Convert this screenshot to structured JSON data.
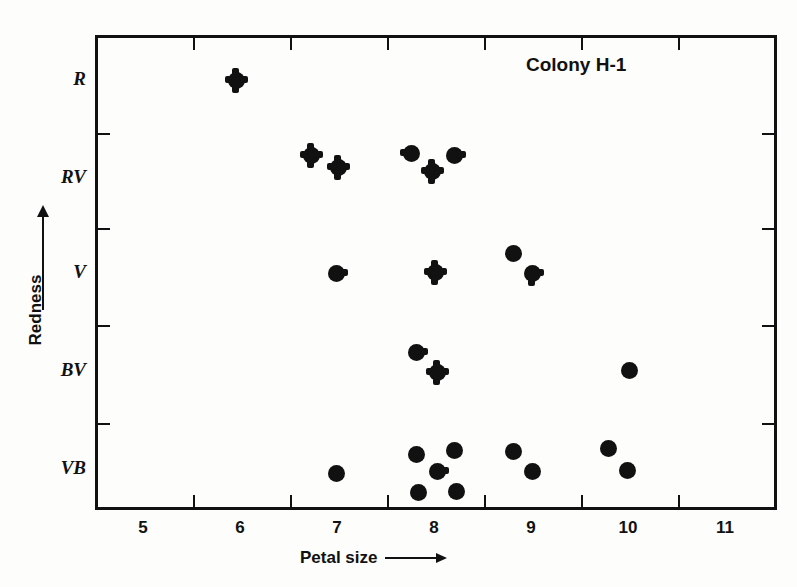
{
  "chart_data": {
    "type": "scatter",
    "title": "Colony H-1",
    "xlabel": "Petal size",
    "ylabel": "Redness",
    "grid": false,
    "legend": null,
    "xlim": [
      4.5,
      11.5
    ],
    "x_ticks": [
      5.5,
      6.5,
      7.5,
      8.5,
      9.5,
      10.5
    ],
    "x_tick_labels": [
      "5",
      "6",
      "7",
      "8",
      "9",
      "10",
      "11"
    ],
    "y_categories": [
      "VB",
      "BV",
      "V",
      "RV",
      "R"
    ],
    "y_tick_labels": [
      "R",
      "RV",
      "V",
      "BV",
      "VB"
    ],
    "y_axis_direction": "Redness increases upward",
    "points": [
      {
        "x": 5.95,
        "y": "R",
        "marker": "cross"
      },
      {
        "x": 6.72,
        "y": "R-RV",
        "marker": "cross"
      },
      {
        "x": 7.0,
        "y": "R-RV",
        "marker": "cross"
      },
      {
        "x": 7.75,
        "y": "R-RV",
        "marker": "spur-left"
      },
      {
        "x": 8.2,
        "y": "R-RV",
        "marker": "spur-right"
      },
      {
        "x": 7.97,
        "y": "R-RV",
        "marker": "cross"
      },
      {
        "x": 6.98,
        "y": "V",
        "marker": "spur-right"
      },
      {
        "x": 8.0,
        "y": "V",
        "marker": "cross"
      },
      {
        "x": 8.8,
        "y": "V",
        "marker": "circle"
      },
      {
        "x": 9.0,
        "y": "V",
        "marker": "spur-right-down"
      },
      {
        "x": 7.8,
        "y": "BV",
        "marker": "spur-right"
      },
      {
        "x": 8.02,
        "y": "BV",
        "marker": "cross"
      },
      {
        "x": 10.0,
        "y": "BV",
        "marker": "circle"
      },
      {
        "x": 6.98,
        "y": "VB",
        "marker": "circle"
      },
      {
        "x": 7.8,
        "y": "VB",
        "marker": "circle"
      },
      {
        "x": 8.2,
        "y": "VB",
        "marker": "circle"
      },
      {
        "x": 8.02,
        "y": "VB",
        "marker": "spur-right"
      },
      {
        "x": 7.82,
        "y": "VB",
        "marker": "circle"
      },
      {
        "x": 8.22,
        "y": "VB",
        "marker": "circle"
      },
      {
        "x": 8.8,
        "y": "VB",
        "marker": "circle"
      },
      {
        "x": 9.0,
        "y": "VB",
        "marker": "circle"
      },
      {
        "x": 9.78,
        "y": "VB",
        "marker": "circle"
      },
      {
        "x": 9.98,
        "y": "VB",
        "marker": "circle"
      }
    ]
  },
  "colors": {
    "ink": "#111111",
    "paper": "#fdfdfb"
  }
}
